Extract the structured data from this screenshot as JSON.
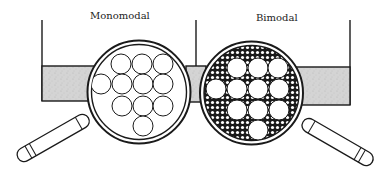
{
  "labels": {
    "left": "Monomodal",
    "right": "Bimodal"
  },
  "colors": {
    "stroke": "#1a1a1a",
    "band_fill": "#d9d9d9",
    "background": "#ffffff",
    "small_particle_fill": "#1a1a1a"
  },
  "geometry": {
    "left_circle": {
      "cx": 139,
      "cy": 92,
      "r_outer": 51.5,
      "r_inner": 47.5
    },
    "right_circle": {
      "cx": 251.5,
      "cy": 93,
      "r_outer": 51.5,
      "r_inner": 47.5
    },
    "particle_radius": 10,
    "left_particles": [
      [
        121,
        64
      ],
      [
        142,
        64
      ],
      [
        163,
        64
      ],
      [
        101,
        84
      ],
      [
        122,
        84
      ],
      [
        143,
        84
      ],
      [
        163,
        84
      ],
      [
        122,
        106
      ],
      [
        143,
        106
      ],
      [
        163,
        106
      ],
      [
        143,
        126
      ]
    ],
    "right_particles": [
      [
        237,
        68
      ],
      [
        258,
        68
      ],
      [
        278,
        68
      ],
      [
        216,
        89
      ],
      [
        237,
        89
      ],
      [
        258,
        89
      ],
      [
        279,
        89
      ],
      [
        237,
        110
      ],
      [
        258,
        110
      ],
      [
        279,
        110
      ],
      [
        258,
        130
      ]
    ]
  }
}
